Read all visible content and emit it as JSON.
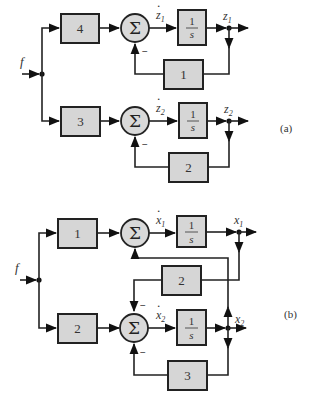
{
  "diagram_a": {
    "tag": "(a)",
    "input_label": "f",
    "top": {
      "gain": "4",
      "sum_symbol": "Σ",
      "deriv_label": "z",
      "deriv_sub": "1",
      "int_num": "1",
      "int_den": "s",
      "out_label": "z",
      "out_sub": "1",
      "feedback_gain": "1",
      "feedback_sign": "−"
    },
    "bottom": {
      "gain": "3",
      "sum_symbol": "Σ",
      "deriv_label": "z",
      "deriv_sub": "2",
      "int_num": "1",
      "int_den": "s",
      "out_label": "z",
      "out_sub": "2",
      "feedback_gain": "2",
      "feedback_sign": "−"
    }
  },
  "diagram_b": {
    "tag": "(b)",
    "input_label": "f",
    "top": {
      "gain": "1",
      "sum_symbol": "Σ",
      "deriv_label": "x",
      "deriv_sub": "1",
      "int_num": "1",
      "int_den": "s",
      "out_label": "x",
      "out_sub": "1"
    },
    "cross_gain": "2",
    "cross_sign": "−",
    "bottom": {
      "gain": "2",
      "sum_symbol": "Σ",
      "deriv_label": "x",
      "deriv_sub": "2",
      "int_num": "1",
      "int_den": "s",
      "out_label": "x",
      "out_sub": "2",
      "feedback_gain": "3",
      "feedback_sign": "−"
    }
  }
}
